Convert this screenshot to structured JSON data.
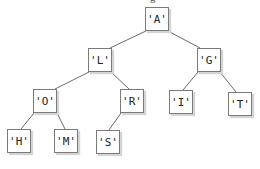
{
  "title_partial": "g",
  "nodes": [
    {
      "id": "A",
      "label": "'A'",
      "x": 145,
      "y": 7
    },
    {
      "id": "L",
      "label": "'L'",
      "x": 88,
      "y": 48
    },
    {
      "id": "G",
      "label": "'G'",
      "x": 197,
      "y": 48
    },
    {
      "id": "O",
      "label": "'O'",
      "x": 33,
      "y": 89
    },
    {
      "id": "R",
      "label": "'R'",
      "x": 120,
      "y": 89
    },
    {
      "id": "I",
      "label": "'I'",
      "x": 169,
      "y": 90
    },
    {
      "id": "T",
      "label": "'T'",
      "x": 228,
      "y": 92
    },
    {
      "id": "H",
      "label": "'H'",
      "x": 7,
      "y": 129
    },
    {
      "id": "M",
      "label": "'M'",
      "x": 54,
      "y": 129
    },
    {
      "id": "S",
      "label": "'S'",
      "x": 96,
      "y": 130
    }
  ],
  "edges": [
    {
      "from": "A",
      "to": "L"
    },
    {
      "from": "A",
      "to": "G"
    },
    {
      "from": "L",
      "to": "O"
    },
    {
      "from": "L",
      "to": "R"
    },
    {
      "from": "G",
      "to": "I"
    },
    {
      "from": "G",
      "to": "T"
    },
    {
      "from": "O",
      "to": "H"
    },
    {
      "from": "O",
      "to": "M"
    },
    {
      "from": "R",
      "to": "S"
    }
  ],
  "colors": {
    "edge": "#6a6a6a",
    "border": "#7a7a7a",
    "shadow": "#d4d4d4"
  }
}
